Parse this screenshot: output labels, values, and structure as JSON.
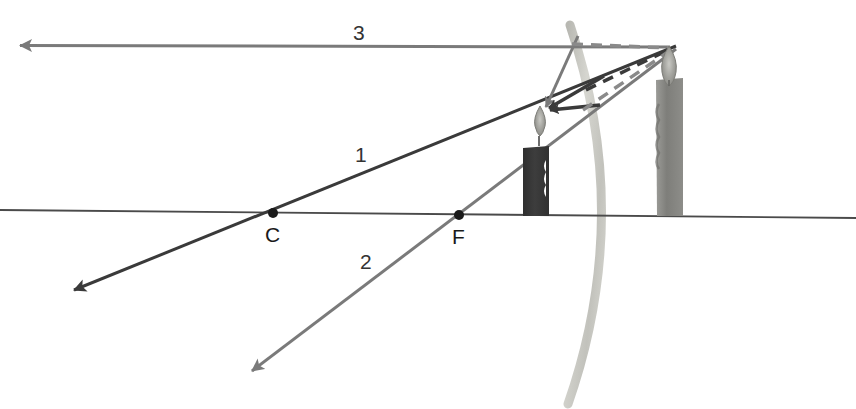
{
  "figure": {
    "background_color": "#ffffff"
  },
  "labels": {
    "ray_1": "1",
    "ray_2": "2",
    "ray_3": "3",
    "center_of_curvature": "C",
    "focal_point": "F"
  },
  "colors": {
    "principal_axis": "#4a4a4a",
    "ray_dark": "#3a3a3a",
    "ray_gray": "#7a7a7a",
    "mirror_light": "#cfcfc9",
    "mirror_mid": "#b3b3ad",
    "object_candle_body": "#3a3a3a",
    "image_candle_body": "#8a8a8a",
    "flame_gray": "#9a9a96",
    "dashed_dark": "#3a3a3a",
    "dashed_gray": "#8a8a8a",
    "point_marker": "#1a1a1a",
    "text": "#333333"
  },
  "geometry": {
    "principal_axis": {
      "x1": 0,
      "y1": 210,
      "x2": 856,
      "y2": 218
    },
    "center_of_curvature_point": {
      "x": 273,
      "y": 213,
      "radius": 5
    },
    "focal_point": {
      "x": 459,
      "y": 215,
      "radius": 5
    },
    "object_flame_tip": {
      "x": 541,
      "y": 110
    },
    "image_flame_tip": {
      "x": 670,
      "y": 50
    },
    "mirror_vertex": {
      "x": 597,
      "y": 214
    },
    "mirror_top": {
      "x": 570,
      "y": 25
    },
    "mirror_bottom": {
      "x": 568,
      "y": 404
    }
  },
  "rays": [
    {
      "id": "ray-1",
      "label": "1",
      "description": "Ray through center of curvature C, reflects back on itself",
      "color": "#3a3a3a",
      "from": {
        "x": 62,
        "y": 296
      },
      "to": {
        "x": 676,
        "y": 46
      },
      "arrow_at": "both-ends"
    },
    {
      "id": "ray-2",
      "label": "2",
      "description": "Ray aimed at focal point F, reflects parallel to axis",
      "color": "#7a7a7a",
      "from": {
        "x": 240,
        "y": 380
      },
      "to": {
        "x": 676,
        "y": 49
      },
      "arrow_at": "lower-left"
    },
    {
      "id": "ray-3",
      "label": "3",
      "description": "Ray parallel to principal axis, reflects as if from focal point",
      "color": "#7a7a7a",
      "from": {
        "x": 670,
        "y": 47
      },
      "to": {
        "x": 8,
        "y": 45
      },
      "arrow_at": "left-end"
    }
  ],
  "reflected_rays_to_object": [
    {
      "id": "reflected-a",
      "from": {
        "x": 572,
        "y": 43
      },
      "to": {
        "x": 543,
        "y": 111
      }
    },
    {
      "id": "reflected-b",
      "from": {
        "x": 596,
        "y": 82
      },
      "to": {
        "x": 543,
        "y": 111
      }
    },
    {
      "id": "reflected-c",
      "from": {
        "x": 593,
        "y": 105
      },
      "to": {
        "x": 543,
        "y": 111
      }
    }
  ],
  "dashed_construction_lines": [
    {
      "id": "dashed-horizontal",
      "from": {
        "x": 572,
        "y": 44
      },
      "to": {
        "x": 669,
        "y": 48
      },
      "color": "#8a8a8a"
    },
    {
      "id": "dashed-upper-diagonal",
      "from": {
        "x": 588,
        "y": 88
      },
      "to": {
        "x": 669,
        "y": 50
      },
      "color": "#3a3a3a"
    },
    {
      "id": "dashed-lower-diagonal",
      "from": {
        "x": 585,
        "y": 108
      },
      "to": {
        "x": 669,
        "y": 52
      },
      "color": "#8a8a8a"
    }
  ],
  "object_candle": {
    "name": "object-candle",
    "body": {
      "x": 523,
      "y": 146,
      "width": 26,
      "height": 70
    },
    "flame": {
      "cx": 539,
      "cy": 124,
      "height": 34,
      "width": 12
    }
  },
  "image_candle": {
    "name": "image-candle-virtual",
    "body": {
      "x": 655,
      "y": 78,
      "width": 28,
      "height": 138
    },
    "flame": {
      "cx": 669,
      "cy": 64,
      "height": 38,
      "width": 14
    }
  },
  "mirror": {
    "name": "convex-mirror",
    "description": "Convex mirror arc bulging toward the right",
    "path": "M 570 25 Q 634 215 568 404"
  }
}
